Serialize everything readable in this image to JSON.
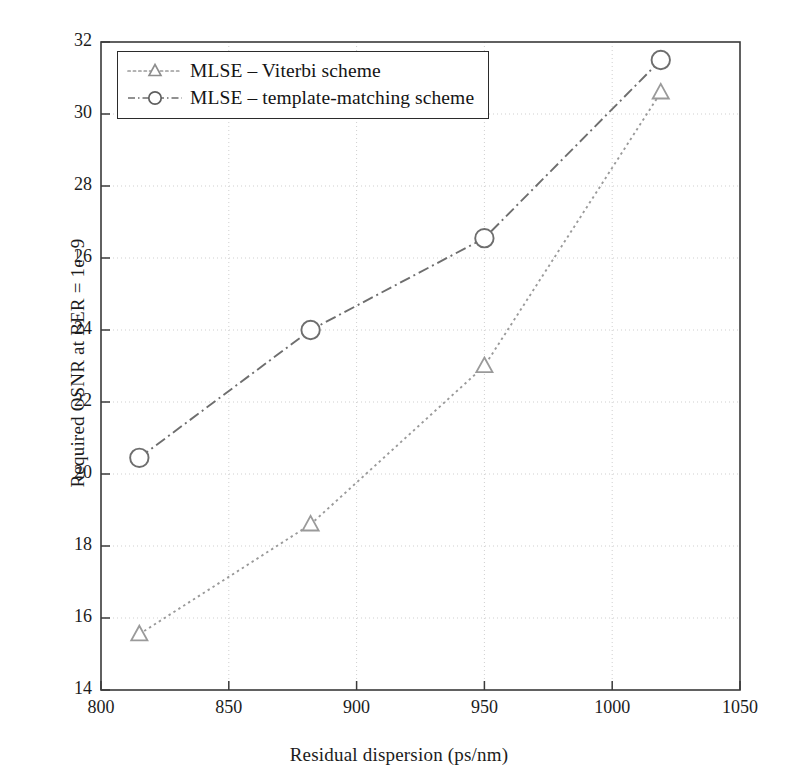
{
  "chart_data": {
    "type": "line",
    "title": "",
    "xlabel": "Residual dispersion (ps/nm)",
    "ylabel": "Required OSNR at BER = 1e−9",
    "xlim": [
      800,
      1050
    ],
    "ylim": [
      14,
      32
    ],
    "xticks": [
      800,
      850,
      900,
      950,
      1000,
      1050
    ],
    "yticks": [
      14,
      16,
      18,
      20,
      22,
      24,
      26,
      28,
      30,
      32
    ],
    "xtick_labels": [
      "800",
      "850",
      "900",
      "950",
      "1000",
      "1050"
    ],
    "ytick_labels": [
      "14",
      "16",
      "18",
      "20",
      "22",
      "24",
      "26",
      "28",
      "30",
      "32"
    ],
    "grid": true,
    "grid_style": "dotted",
    "grid_color": "#cfcfcf",
    "legend_position": "upper left",
    "series": [
      {
        "name": "MLSE – Viterbi scheme",
        "marker": "triangle",
        "line_style": "dotted",
        "color": "#9a9a9a",
        "x": [
          815,
          882,
          950,
          1019
        ],
        "values": [
          15.55,
          18.6,
          23.0,
          30.6
        ]
      },
      {
        "name": "MLSE – template-matching scheme",
        "marker": "circle",
        "line_style": "dash-dot",
        "color": "#6e6e6e",
        "x": [
          815,
          882,
          950,
          1019
        ],
        "values": [
          20.45,
          24.0,
          26.55,
          31.5
        ]
      }
    ]
  },
  "legend": {
    "items": [
      {
        "label": "MLSE – Viterbi scheme",
        "marker": "triangle-marker-icon",
        "line_style": "dotted"
      },
      {
        "label": "MLSE – template-matching scheme",
        "marker": "circle-marker-icon",
        "line_style": "dash-dot"
      }
    ]
  },
  "axes": {
    "frame_color": "#3a3a3a",
    "tick_color": "#3a3a3a"
  }
}
